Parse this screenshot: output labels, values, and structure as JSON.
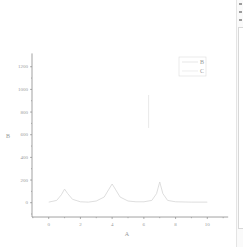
{
  "chart_data": {
    "type": "line",
    "title": "",
    "xlabel": "A",
    "ylabel": "B",
    "xlim": [
      -1,
      11
    ],
    "ylim": [
      -100,
      1300
    ],
    "xticks": [
      0,
      2,
      4,
      6,
      8,
      10
    ],
    "yticks": [
      0,
      200,
      400,
      600,
      800,
      1000,
      1200
    ],
    "grid": false,
    "legend_position": "top-right",
    "legend": [
      "B",
      "C"
    ],
    "series": [
      {
        "name": "B",
        "x": [
          0,
          0.5,
          0.8,
          1.0,
          1.2,
          1.5,
          2.0,
          2.5,
          3.0,
          3.5,
          3.8,
          4.0,
          4.2,
          4.5,
          5.0,
          5.5,
          6.0,
          6.5,
          6.8,
          7.0,
          7.2,
          7.5,
          8.0,
          9.0,
          10.0
        ],
        "y": [
          5,
          20,
          70,
          120,
          80,
          30,
          8,
          5,
          15,
          50,
          120,
          165,
          120,
          50,
          15,
          8,
          8,
          20,
          80,
          183,
          80,
          20,
          8,
          5,
          5
        ]
      },
      {
        "name": "C",
        "x": [
          6.3,
          6.3
        ],
        "y": [
          660,
          950
        ]
      }
    ]
  },
  "legend": {
    "items": [
      {
        "label": "B"
      },
      {
        "label": "C"
      }
    ]
  },
  "axes": {
    "x_title": "A",
    "y_title": "B",
    "x_tick_labels": [
      "0",
      "2",
      "4",
      "6",
      "8",
      "10"
    ],
    "y_tick_labels": [
      "0",
      "200",
      "400",
      "600",
      "800",
      "1000",
      "1200"
    ]
  },
  "colors": {
    "axis": "#7a7a7a",
    "series_b": "#d6d6d6",
    "series_c": "#e2e2e2",
    "text": "#9a9a9a"
  }
}
